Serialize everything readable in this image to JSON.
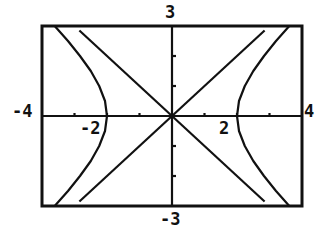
{
  "chart_data": {
    "type": "line",
    "title": "",
    "xlabel": "",
    "ylabel": "",
    "xlim": [
      -4,
      4
    ],
    "ylim": [
      -3,
      3
    ],
    "grid": false,
    "axis_labels": {
      "xmin": "-4",
      "xmax": "4",
      "ymin": "-3",
      "ymax": "3",
      "tick_neg": "-2",
      "tick_pos": "2"
    },
    "x_ticks": [
      -3,
      -2,
      -1,
      1,
      2,
      3
    ],
    "y_ticks": [
      -2,
      -1,
      1,
      2
    ],
    "series": [
      {
        "name": "asymptote y = x",
        "equation": "y = x",
        "x": [
          -3,
          3
        ],
        "y": [
          -3,
          3
        ]
      },
      {
        "name": "asymptote y = -x",
        "equation": "y = -x",
        "x": [
          -3,
          3
        ],
        "y": [
          3,
          -3
        ]
      },
      {
        "name": "hyperbola right branch",
        "equation": "x^2 - y^2 = 4",
        "x": [
          3.61,
          3.2,
          2.83,
          2.5,
          2.24,
          2.06,
          2.0,
          2.06,
          2.24,
          2.5,
          2.83,
          3.2,
          3.61
        ],
        "y": [
          3,
          2.5,
          2,
          1.5,
          1,
          0.5,
          0,
          -0.5,
          -1,
          -1.5,
          -2,
          -2.5,
          -3
        ]
      },
      {
        "name": "hyperbola left branch",
        "equation": "x^2 - y^2 = 4",
        "x": [
          -3.61,
          -3.2,
          -2.83,
          -2.5,
          -2.24,
          -2.06,
          -2.0,
          -2.06,
          -2.24,
          -2.5,
          -2.83,
          -3.2,
          -3.61
        ],
        "y": [
          3,
          2.5,
          2,
          1.5,
          1,
          0.5,
          0,
          -0.5,
          -1,
          -1.5,
          -2,
          -2.5,
          -3
        ]
      }
    ],
    "colors": {
      "ink": "#111111",
      "background": "#ffffff"
    }
  }
}
